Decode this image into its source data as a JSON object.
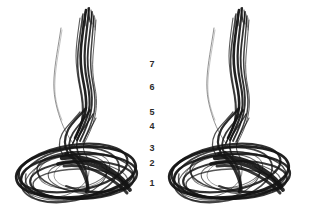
{
  "figure": {
    "title": "",
    "background_color": "#ffffff",
    "ink_color": "#141414",
    "label_color": "#2b2b2b",
    "type": "stereo-pair-phase-portrait"
  },
  "axis_labels": {
    "name": "vertical-tick-labels",
    "items": [
      {
        "text": "7",
        "top": 60
      },
      {
        "text": "6",
        "top": 83
      },
      {
        "text": "5",
        "top": 108
      },
      {
        "text": "4",
        "top": 122
      },
      {
        "text": "3",
        "top": 144
      },
      {
        "text": "2",
        "top": 159
      },
      {
        "text": "1",
        "top": 179
      }
    ]
  },
  "panels": [
    {
      "name": "left-stereo-view",
      "label": ""
    },
    {
      "name": "right-stereo-view",
      "label": ""
    }
  ],
  "chart_data": {
    "type": "line",
    "title": "",
    "subtitle": "",
    "xlabel": "",
    "ylabel": "",
    "legend": [],
    "grid": false,
    "tick_values": [
      7,
      6,
      5,
      4,
      3,
      2,
      1
    ],
    "tick_pixel_tops": [
      60,
      83,
      108,
      122,
      144,
      159,
      179
    ],
    "ylim": [
      1,
      7
    ],
    "series": [
      {
        "name": "attractor-trajectory",
        "n_views": 2,
        "description": "dense ink-drawn orbit bundle"
      }
    ]
  }
}
